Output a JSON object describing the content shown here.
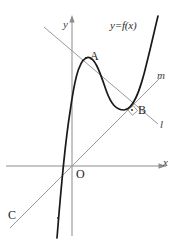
{
  "figure": {
    "kind": "coordinate-diagram",
    "width": 176,
    "height": 243,
    "background": "#ffffff"
  },
  "axes": {
    "x_label": "x",
    "y_label": "y",
    "origin_label": "O",
    "color": "#8c8c8c",
    "x_axis_y": 166,
    "y_axis_x": 72,
    "x_axis_from": 6,
    "x_axis_to": 170,
    "y_axis_from": 14,
    "y_axis_to": 236
  },
  "curve": {
    "label": "y=f(x)",
    "color": "#1a1a1a",
    "description": "cubic with local maximum at A and local minimum near B"
  },
  "lines": [
    {
      "name": "l",
      "label": "l",
      "color": "#9a9a9a",
      "description": "line through A descending to lower right past B"
    },
    {
      "name": "m",
      "label": "m",
      "color": "#9a9a9a",
      "description": "line through C and origin O ascending to upper right through B"
    }
  ],
  "points": [
    {
      "id": "A",
      "label": "A",
      "description": "point on curve at local maximum"
    },
    {
      "id": "B",
      "label": "B",
      "description": "intersection of lines l and m on the curve"
    },
    {
      "id": "C",
      "label": "C",
      "description": "point where curve meets line m at lower left"
    }
  ],
  "markers": {
    "right_angle_at": "B",
    "right_angle_note": "small square indicating l is perpendicular to m"
  },
  "colors": {
    "curve": "#1a1a1a",
    "axis": "#8c8c8c",
    "line": "#9a9a9a",
    "text": "#242424",
    "background": "#ffffff"
  }
}
